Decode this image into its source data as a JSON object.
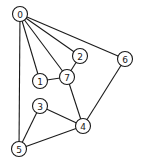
{
  "graph": {
    "title": "",
    "node_radius": 7.5,
    "nodes": [
      {
        "id": "0",
        "label": "0",
        "x": 20,
        "y": 14
      },
      {
        "id": "1",
        "label": "1",
        "x": 40,
        "y": 81
      },
      {
        "id": "2",
        "label": "2",
        "x": 80,
        "y": 56
      },
      {
        "id": "3",
        "label": "3",
        "x": 40,
        "y": 106
      },
      {
        "id": "4",
        "label": "4",
        "x": 83,
        "y": 126
      },
      {
        "id": "5",
        "label": "5",
        "x": 19,
        "y": 149
      },
      {
        "id": "6",
        "label": "6",
        "x": 125,
        "y": 59
      },
      {
        "id": "7",
        "label": "7",
        "x": 67,
        "y": 77
      }
    ],
    "edges": [
      {
        "from": "0",
        "to": "1"
      },
      {
        "from": "0",
        "to": "7"
      },
      {
        "from": "0",
        "to": "2"
      },
      {
        "from": "0",
        "to": "6"
      },
      {
        "from": "0",
        "to": "5"
      },
      {
        "from": "1",
        "to": "7"
      },
      {
        "from": "2",
        "to": "7"
      },
      {
        "from": "7",
        "to": "4"
      },
      {
        "from": "6",
        "to": "4"
      },
      {
        "from": "3",
        "to": "4"
      },
      {
        "from": "3",
        "to": "5"
      },
      {
        "from": "5",
        "to": "4"
      }
    ],
    "colors": {
      "stroke": "#1a1a1a",
      "fill": "#ffffff",
      "background": "#ffffff"
    }
  }
}
